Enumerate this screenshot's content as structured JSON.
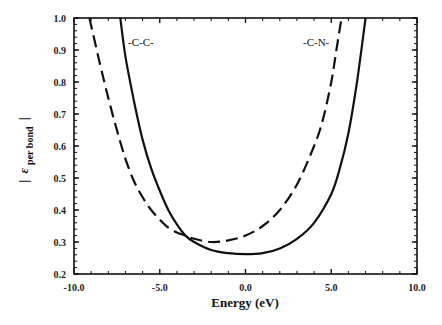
{
  "chart_data": {
    "type": "line",
    "title": "",
    "xlabel": "Energy (eV)",
    "ylabel": "| ε per bond |",
    "ylabel_main": "ε",
    "ylabel_sub": "per bond",
    "xlim": [
      -10.0,
      10.0
    ],
    "ylim": [
      0.2,
      1.0
    ],
    "xticks": [
      "-10.0",
      "-5.0",
      "0.0",
      "5.0",
      "10.0"
    ],
    "yticks": [
      "0.2",
      "0.3",
      "0.4",
      "0.5",
      "0.6",
      "0.7",
      "0.8",
      "0.9",
      "1.0"
    ],
    "grid": false,
    "legend_position": "inline labels",
    "series": [
      {
        "name": "-C-C-",
        "style": "solid",
        "x": [
          -7.3,
          -7.0,
          -6.5,
          -6.0,
          -5.5,
          -5.0,
          -4.5,
          -4.0,
          -3.5,
          -3.0,
          -2.0,
          -1.0,
          0.0,
          1.0,
          2.0,
          3.0,
          4.0,
          5.0,
          5.5,
          6.0,
          6.5,
          7.0
        ],
        "values": [
          1.0,
          0.88,
          0.74,
          0.62,
          0.53,
          0.46,
          0.4,
          0.355,
          0.32,
          0.3,
          0.275,
          0.265,
          0.262,
          0.265,
          0.28,
          0.31,
          0.36,
          0.45,
          0.53,
          0.64,
          0.8,
          1.0
        ]
      },
      {
        "name": "-C-N-",
        "style": "dashed",
        "x": [
          -9.1,
          -8.5,
          -8.0,
          -7.5,
          -7.0,
          -6.5,
          -6.0,
          -5.5,
          -5.0,
          -4.5,
          -4.0,
          -3.5,
          -3.0,
          -2.0,
          -1.0,
          0.0,
          1.0,
          2.0,
          3.0,
          4.0,
          4.5,
          5.0,
          5.3,
          5.6
        ],
        "values": [
          1.0,
          0.86,
          0.75,
          0.65,
          0.56,
          0.49,
          0.44,
          0.4,
          0.37,
          0.345,
          0.33,
          0.32,
          0.31,
          0.3,
          0.305,
          0.32,
          0.35,
          0.4,
          0.48,
          0.6,
          0.68,
          0.8,
          0.9,
          1.0
        ]
      }
    ],
    "annotations": [
      {
        "text": "-C-C-",
        "x": -6.8,
        "y": 0.91
      },
      {
        "text": "-C-N-",
        "x": 2.1,
        "y": 0.91
      }
    ]
  },
  "labels": {
    "series_cc": "-C-C-",
    "series_cn": "-C-N-",
    "xlabel": "Energy (eV)",
    "ylabel_bar_left": "|",
    "ylabel_main": "ε",
    "ylabel_sub": "per bond",
    "ylabel_bar_right": "|"
  }
}
